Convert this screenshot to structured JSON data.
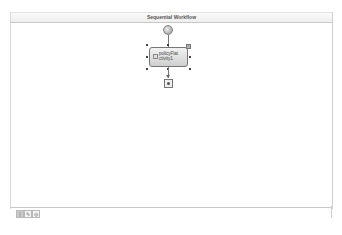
{
  "designer": {
    "title": "Sequential Workflow"
  },
  "workflow": {
    "start_icon": "workflow-start-icon",
    "activities": [
      {
        "name": "policyActivity1",
        "label_line1": "policyFlat",
        "label_line2": "ctivity1",
        "icon": "activity-icon",
        "selected": true
      }
    ],
    "end_icon": "workflow-end-icon",
    "smart_tag": "!"
  },
  "view_tabs": [
    {
      "name": "workflow-view",
      "glyph": "|",
      "active": true
    },
    {
      "name": "cancel-handler-view",
      "glyph": "✎",
      "active": false
    },
    {
      "name": "fault-handlers-view",
      "glyph": "◎",
      "active": false
    }
  ]
}
